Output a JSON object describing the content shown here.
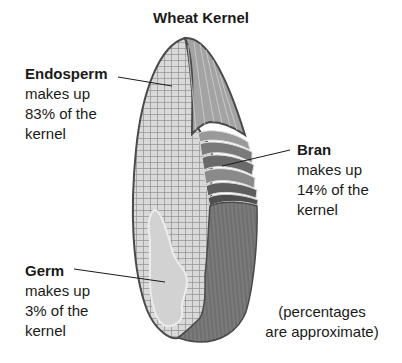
{
  "title": "Wheat Kernel",
  "labels": {
    "endosperm": {
      "name": "Endosperm",
      "lines": [
        "makes up",
        "83% of the",
        "kernel"
      ],
      "percent": 83
    },
    "bran": {
      "name": "Bran",
      "lines": [
        "makes up",
        "14% of the",
        "kernel"
      ],
      "percent": 14
    },
    "germ": {
      "name": "Germ",
      "lines": [
        "makes up",
        "3% of the",
        "kernel"
      ],
      "percent": 3
    }
  },
  "note": {
    "lines": [
      "(percentages",
      "are approximate)"
    ]
  },
  "colors": {
    "endosperm_fill": "#d6d6d6",
    "endosperm_grid": "#8a8a8a",
    "bran_dark": "#6e6e6e",
    "bran_light": "#b5b5b5",
    "outline": "#4a4a4a",
    "germ_fill": "#cfcfcf"
  }
}
